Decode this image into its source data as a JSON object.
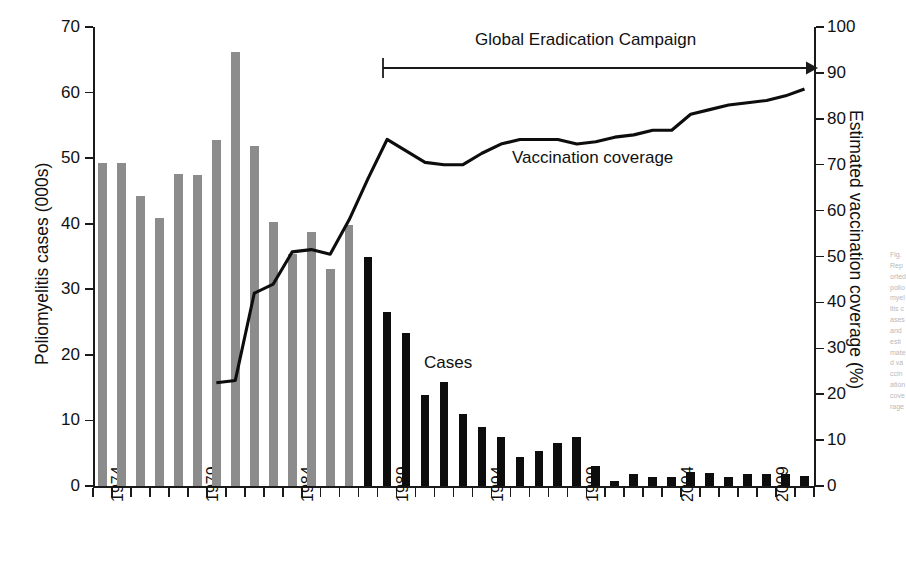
{
  "chart_data": {
    "type": "bar",
    "title": "",
    "subtitle": "",
    "xlabel": "",
    "ylabel": "Poliomyelitis cases (000s)",
    "y2label": "Estimated vaccination coverage (%)",
    "ylim": [
      0,
      70
    ],
    "y2lim": [
      0,
      100
    ],
    "grid": false,
    "legend_position": "inline-annotations",
    "x": [
      1974,
      1975,
      1976,
      1977,
      1978,
      1979,
      1980,
      1981,
      1982,
      1983,
      1984,
      1985,
      1986,
      1987,
      1988,
      1989,
      1990,
      1991,
      1992,
      1993,
      1994,
      1995,
      1996,
      1997,
      1998,
      1999,
      2000,
      2001,
      2002,
      2003,
      2004,
      2005,
      2006,
      2007,
      2008,
      2009,
      2010,
      2011
    ],
    "xtick_labels": [
      "1974",
      "1979",
      "1984",
      "1989",
      "1994",
      "1999",
      "2004",
      "2009"
    ],
    "xtick_years": [
      1974,
      1979,
      1984,
      1989,
      1994,
      1999,
      2004,
      2009
    ],
    "ytick_labels": [
      "0",
      "10",
      "20",
      "30",
      "40",
      "50",
      "60",
      "70"
    ],
    "ytick_values": [
      0,
      10,
      20,
      30,
      40,
      50,
      60,
      70
    ],
    "y2tick_labels": [
      "0",
      "10",
      "20",
      "30",
      "40",
      "50",
      "60",
      "70",
      "80",
      "90",
      "100"
    ],
    "y2tick_values": [
      0,
      10,
      20,
      30,
      40,
      50,
      60,
      70,
      80,
      90,
      100
    ],
    "series": [
      {
        "name": "Cases",
        "kind": "bar",
        "unit": "000s",
        "axis": "left",
        "colors": {
          "pre_campaign": "#8c8c8c",
          "campaign": "#0d0d0d"
        },
        "campaign_start_year": 1988,
        "values": [
          49.3,
          49.3,
          44.3,
          40.8,
          47.6,
          47.5,
          52.8,
          66.2,
          51.8,
          40.3,
          35.4,
          38.7,
          33.1,
          39.8,
          34.9,
          26.5,
          23.4,
          13.9,
          15.8,
          11.0,
          9.0,
          7.5,
          4.4,
          5.4,
          6.6,
          7.5,
          3.1,
          0.7,
          1.9,
          1.3,
          1.3,
          2.1,
          2.0,
          1.3,
          1.9,
          1.9,
          1.8,
          1.6
        ]
      },
      {
        "name": "Vaccination coverage",
        "kind": "line",
        "unit": "%",
        "axis": "right",
        "color": "#0d0d0d",
        "start_year": 1980,
        "x": [
          1980,
          1981,
          1982,
          1983,
          1984,
          1985,
          1986,
          1987,
          1988,
          1989,
          1990,
          1991,
          1992,
          1993,
          1994,
          1995,
          1996,
          1997,
          1998,
          1999,
          2000,
          2001,
          2002,
          2003,
          2004,
          2005,
          2006,
          2007,
          2008,
          2009,
          2010,
          2011
        ],
        "values": [
          22.5,
          23.0,
          42.0,
          44.0,
          51.0,
          51.5,
          50.5,
          58.0,
          67.0,
          75.5,
          73.0,
          70.5,
          70.0,
          70.0,
          72.5,
          74.5,
          75.5,
          75.5,
          75.5,
          74.5,
          75.0,
          76.0,
          76.5,
          77.5,
          77.5,
          81.0,
          82.0,
          83.0,
          83.5,
          84.0,
          85.0,
          86.5
        ]
      }
    ],
    "annotations": [
      {
        "name": "campaign-annotation",
        "text": "Global Eradication Campaign",
        "start_year": 1988,
        "end_year": 2011,
        "style": "arrow-right"
      },
      {
        "name": "cases-label",
        "text": "Cases",
        "near_year": 1992
      },
      {
        "name": "coverage-label",
        "text": "Vaccination coverage",
        "near_year": 1997
      }
    ]
  },
  "axes": {
    "left": {
      "title": "Poliomyelitis cases (000s)",
      "ticks": [
        "0",
        "10",
        "20",
        "30",
        "40",
        "50",
        "60",
        "70"
      ]
    },
    "right": {
      "title": "Estimated vaccination coverage (%)",
      "ticks": [
        "0",
        "10",
        "20",
        "30",
        "40",
        "50",
        "60",
        "70",
        "80",
        "90",
        "100"
      ]
    },
    "bottom": {
      "ticks": [
        "1974",
        "1979",
        "1984",
        "1989",
        "1994",
        "1999",
        "2004",
        "2009"
      ]
    }
  },
  "labels": {
    "campaign": "Global Eradication Campaign",
    "cases": "Cases",
    "coverage": "Vaccination coverage"
  },
  "colors": {
    "bar_pre": "#8c8c8c",
    "bar_campaign": "#0d0d0d",
    "line": "#0d0d0d",
    "axis": "#1a1a1a",
    "background": "#ffffff"
  },
  "caption_edge": {
    "text": "Fig. Reported poliomyelitis cases and estimated vaccination coverage"
  }
}
